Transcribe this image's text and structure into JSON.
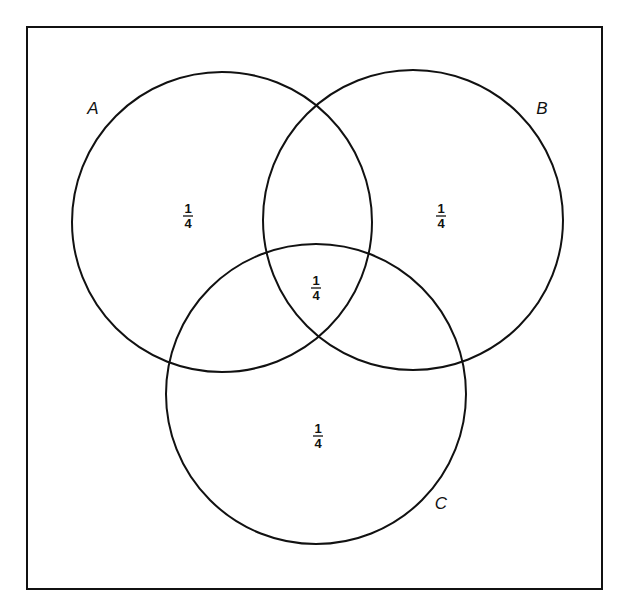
{
  "diagram": {
    "type": "venn",
    "frame": {
      "x": 27,
      "y": 27,
      "width": 575,
      "height": 562,
      "stroke": "#111111"
    },
    "circles": [
      {
        "id": "A",
        "label": "A",
        "cx": 222,
        "cy": 222,
        "r": 150,
        "label_x": 93,
        "label_y": 114
      },
      {
        "id": "B",
        "label": "B",
        "cx": 413,
        "cy": 220,
        "r": 150,
        "label_x": 542,
        "label_y": 114
      },
      {
        "id": "C",
        "label": "C",
        "cx": 316,
        "cy": 394,
        "r": 150,
        "label_x": 441,
        "label_y": 509
      }
    ],
    "regions": [
      {
        "id": "A-only",
        "numerator": "1",
        "denominator": "4",
        "x": 188,
        "y": 216
      },
      {
        "id": "B-only",
        "numerator": "1",
        "denominator": "4",
        "x": 441,
        "y": 216
      },
      {
        "id": "A-B-C",
        "numerator": "1",
        "denominator": "4",
        "x": 316,
        "y": 288
      },
      {
        "id": "C-only",
        "numerator": "1",
        "denominator": "4",
        "x": 318,
        "y": 436
      }
    ],
    "stroke_color": "#111111",
    "background": "#ffffff"
  }
}
